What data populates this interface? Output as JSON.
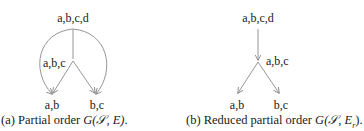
{
  "figures": [
    {
      "id": "a",
      "caption_prefix": "(a) Partial order ",
      "caption_math": "G(𝒮, E)",
      "caption_suffix": ".",
      "nodes": {
        "top": "a,b,c,d",
        "middle": "a,b,c",
        "bottom_left": "a,b",
        "bottom_right": "b,c"
      },
      "edges": [
        [
          "a,b,c,d",
          "a,b,c"
        ],
        [
          "a,b,c,d",
          "a,b"
        ],
        [
          "a,b,c,d",
          "b,c"
        ],
        [
          "a,b,c",
          "a,b"
        ],
        [
          "a,b,c",
          "b,c"
        ]
      ]
    },
    {
      "id": "b",
      "caption_prefix": "(b) Reduced partial order ",
      "caption_math": "G(𝒮, E",
      "caption_sub": "r",
      "caption_suffix": ").",
      "nodes": {
        "top": "a,b,c,d",
        "middle": "a,b,c",
        "bottom_left": "a,b",
        "bottom_right": "b,c"
      },
      "edges": [
        [
          "a,b,c,d",
          "a,b,c"
        ],
        [
          "a,b,c",
          "a,b"
        ],
        [
          "a,b,c",
          "b,c"
        ]
      ]
    }
  ],
  "colors": {
    "edge": "#8a8a8a",
    "text": "#1a1a1a"
  }
}
